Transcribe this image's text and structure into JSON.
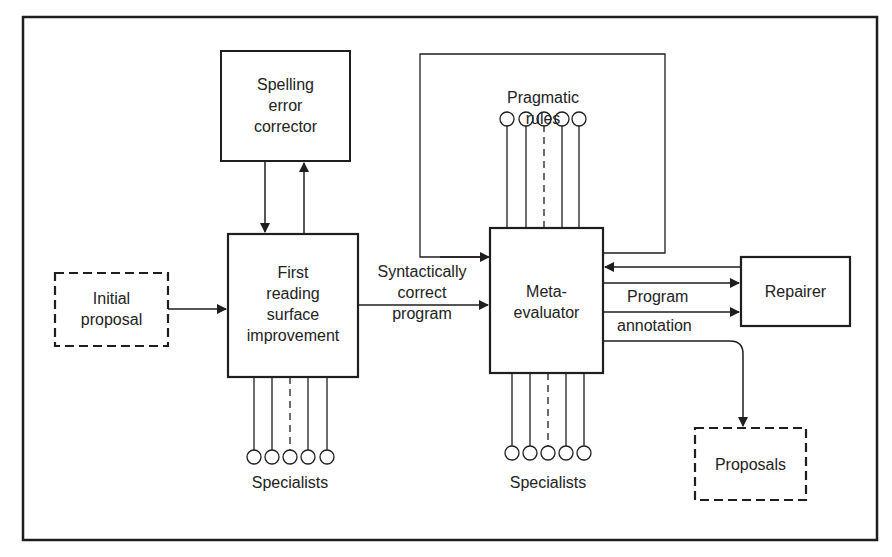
{
  "diagram": {
    "nodes": {
      "spelling": {
        "line1": "Spelling",
        "line2": "error",
        "line3": "corrector"
      },
      "first_reading": {
        "line1": "First",
        "line2": "reading",
        "line3": "surface",
        "line4": "improvement"
      },
      "initial_proposal": {
        "line1": "Initial",
        "line2": "proposal"
      },
      "pragmatic_rules": {
        "line1": "Pragmatic",
        "line2": "rules"
      },
      "meta_evaluator": {
        "line1": "Meta-",
        "line2": "evaluator"
      },
      "repairer": {
        "label": "Repairer"
      },
      "proposals": {
        "label": "Proposals"
      }
    },
    "edges": {
      "syntactic": {
        "line1": "Syntactically",
        "line2": "correct",
        "line3": "program"
      },
      "program": {
        "label": "Program"
      },
      "annotation": {
        "label": "annotation"
      }
    },
    "specialists_left": {
      "label": "Specialists"
    },
    "specialists_right": {
      "label": "Specialists"
    }
  }
}
